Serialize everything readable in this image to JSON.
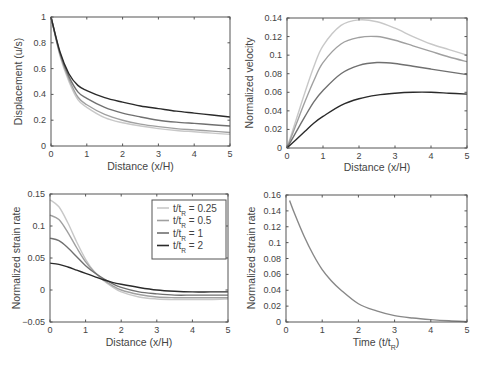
{
  "colors": {
    "t025": "#c8c8c8",
    "t05": "#a0a0a0",
    "t1": "#707070",
    "t2": "#2a2a2a",
    "single": "#888888",
    "axis": "#555555",
    "text": "#444444"
  },
  "chart_data": [
    {
      "id": "displacement",
      "type": "line",
      "title": "",
      "xlabel": "Distance (x/H)",
      "ylabel": "Displacement (u/s)",
      "xlim": [
        0,
        5
      ],
      "ylim": [
        0,
        1
      ],
      "xticks": [
        0,
        1,
        2,
        3,
        4,
        5
      ],
      "yticks": [
        0,
        0.2,
        0.4,
        0.6,
        0.8,
        1
      ],
      "ytick_labels": [
        "0",
        "0.2",
        "0.4",
        "0.6",
        "0.8",
        "1"
      ],
      "grid": false,
      "x": [
        0,
        0.25,
        0.5,
        0.75,
        1,
        1.5,
        2,
        2.5,
        3,
        3.5,
        4,
        4.5,
        5
      ],
      "series": [
        {
          "name": "t/tR = 0.25",
          "color_key": "t025",
          "values": [
            1,
            0.7,
            0.5,
            0.36,
            0.3,
            0.22,
            0.18,
            0.155,
            0.135,
            0.12,
            0.11,
            0.1,
            0.09
          ]
        },
        {
          "name": "t/tR = 0.5",
          "color_key": "t05",
          "values": [
            1,
            0.71,
            0.52,
            0.38,
            0.32,
            0.245,
            0.2,
            0.17,
            0.15,
            0.135,
            0.125,
            0.115,
            0.105
          ]
        },
        {
          "name": "t/tR = 1",
          "color_key": "t1",
          "values": [
            1,
            0.72,
            0.54,
            0.42,
            0.37,
            0.3,
            0.255,
            0.225,
            0.2,
            0.185,
            0.175,
            0.165,
            0.155
          ]
        },
        {
          "name": "t/tR = 2",
          "color_key": "t2",
          "values": [
            1,
            0.73,
            0.56,
            0.47,
            0.43,
            0.375,
            0.34,
            0.31,
            0.29,
            0.27,
            0.255,
            0.24,
            0.225
          ]
        }
      ]
    },
    {
      "id": "velocity",
      "type": "line",
      "title": "",
      "xlabel": "Distance (x/H)",
      "ylabel": "Normalized velocity",
      "xlim": [
        0,
        5
      ],
      "ylim": [
        0,
        0.14
      ],
      "xticks": [
        0,
        1,
        2,
        3,
        4,
        5
      ],
      "yticks": [
        0,
        0.02,
        0.04,
        0.06,
        0.08,
        0.1,
        0.12,
        0.14
      ],
      "ytick_labels": [
        "0",
        "0.02",
        "0.04",
        "0.06",
        "0.08",
        "0.1",
        "0.12",
        "0.14"
      ],
      "grid": false,
      "x": [
        0,
        0.25,
        0.5,
        0.75,
        1,
        1.5,
        2,
        2.5,
        3,
        3.5,
        4,
        4.5,
        5
      ],
      "series": [
        {
          "name": "t/tR = 0.25",
          "color_key": "t025",
          "values": [
            0,
            0.03,
            0.06,
            0.088,
            0.11,
            0.132,
            0.138,
            0.136,
            0.129,
            0.12,
            0.112,
            0.106,
            0.1
          ]
        },
        {
          "name": "t/tR = 0.5",
          "color_key": "t05",
          "values": [
            0,
            0.025,
            0.05,
            0.073,
            0.092,
            0.112,
            0.119,
            0.12,
            0.116,
            0.11,
            0.104,
            0.098,
            0.093
          ]
        },
        {
          "name": "t/tR = 1",
          "color_key": "t1",
          "values": [
            0,
            0.017,
            0.034,
            0.05,
            0.062,
            0.08,
            0.089,
            0.092,
            0.091,
            0.088,
            0.085,
            0.082,
            0.079
          ]
        },
        {
          "name": "t/tR = 2",
          "color_key": "t2",
          "values": [
            0,
            0.009,
            0.018,
            0.027,
            0.034,
            0.046,
            0.053,
            0.057,
            0.059,
            0.06,
            0.06,
            0.059,
            0.058
          ]
        }
      ]
    },
    {
      "id": "strain-rate-distance",
      "type": "line",
      "title": "",
      "xlabel": "Distance (x/H)",
      "ylabel": "Normalized strain rate",
      "xlim": [
        0,
        5
      ],
      "ylim": [
        -0.05,
        0.15
      ],
      "xticks": [
        0,
        1,
        2,
        3,
        4,
        5
      ],
      "yticks": [
        -0.05,
        0,
        0.05,
        0.1,
        0.15
      ],
      "ytick_labels": [
        "−0.05",
        "0",
        "0.05",
        "0.1",
        "0.15"
      ],
      "grid": false,
      "legend": {
        "position": "upper right",
        "entries": [
          {
            "label_main": "t/t",
            "label_sub": "R",
            "label_rest": " = 0.25",
            "color_key": "t025"
          },
          {
            "label_main": "t/t",
            "label_sub": "R",
            "label_rest": " = 0.5",
            "color_key": "t05"
          },
          {
            "label_main": "t/t",
            "label_sub": "R",
            "label_rest": " = 1",
            "color_key": "t1"
          },
          {
            "label_main": "t/t",
            "label_sub": "R",
            "label_rest": " = 2",
            "color_key": "t2"
          }
        ]
      },
      "x": [
        0,
        0.25,
        0.5,
        0.75,
        1,
        1.25,
        1.5,
        1.75,
        2,
        2.5,
        3,
        3.5,
        4,
        4.5,
        5
      ],
      "series": [
        {
          "name": "t/tR = 0.25",
          "color_key": "t025",
          "values": [
            0.141,
            0.13,
            0.105,
            0.075,
            0.048,
            0.028,
            0.015,
            0.005,
            -0.003,
            -0.011,
            -0.014,
            -0.015,
            -0.015,
            -0.015,
            -0.014
          ]
        },
        {
          "name": "t/tR = 0.5",
          "color_key": "t05",
          "values": [
            0.117,
            0.11,
            0.09,
            0.066,
            0.044,
            0.028,
            0.016,
            0.007,
            0.0,
            -0.007,
            -0.011,
            -0.012,
            -0.012,
            -0.012,
            -0.012
          ]
        },
        {
          "name": "t/tR = 1",
          "color_key": "t1",
          "values": [
            0.081,
            0.077,
            0.066,
            0.052,
            0.038,
            0.027,
            0.018,
            0.01,
            0.004,
            -0.003,
            -0.006,
            -0.008,
            -0.008,
            -0.008,
            -0.008
          ]
        },
        {
          "name": "t/tR = 2",
          "color_key": "t2",
          "values": [
            0.042,
            0.04,
            0.036,
            0.031,
            0.026,
            0.021,
            0.016,
            0.012,
            0.009,
            0.004,
            0.0,
            -0.002,
            -0.003,
            -0.003,
            -0.003
          ]
        }
      ]
    },
    {
      "id": "strain-rate-time",
      "type": "line",
      "title": "",
      "xlabel_main": "Time (t/t",
      "xlabel_sub": "R",
      "xlabel_rest": ")",
      "ylabel": "Normalized strain rate",
      "xlim": [
        0,
        5
      ],
      "ylim": [
        0,
        0.16
      ],
      "xticks": [
        0,
        1,
        2,
        3,
        4,
        5
      ],
      "yticks": [
        0,
        0.02,
        0.04,
        0.06,
        0.08,
        0.1,
        0.12,
        0.14,
        0.16
      ],
      "ytick_labels": [
        "0",
        "0.02",
        "0.04",
        "0.06",
        "0.08",
        "0.1",
        "0.12",
        "0.14",
        "0.16"
      ],
      "grid": false,
      "x": [
        0.1,
        0.25,
        0.5,
        0.75,
        1,
        1.25,
        1.5,
        2,
        2.5,
        3,
        3.5,
        4,
        4.5,
        5
      ],
      "series": [
        {
          "name": "strain rate",
          "color_key": "single",
          "values": [
            0.153,
            0.135,
            0.108,
            0.085,
            0.066,
            0.052,
            0.041,
            0.023,
            0.014,
            0.008,
            0.005,
            0.003,
            0.0015,
            0.0005
          ]
        }
      ]
    }
  ]
}
